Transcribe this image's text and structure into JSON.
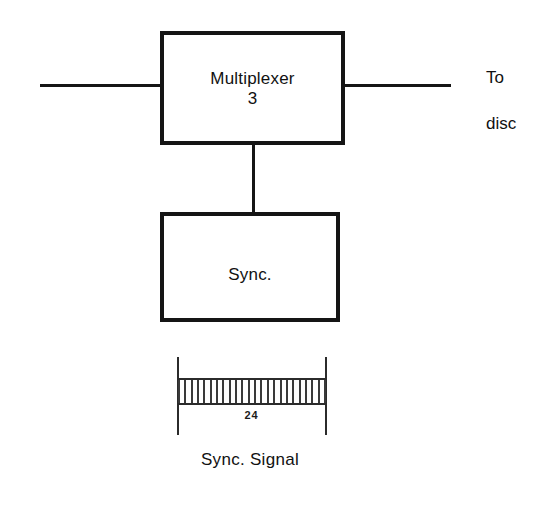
{
  "diagram": {
    "background_color": "#ffffff",
    "line_color": "#151515",
    "blocks": [
      {
        "name": "multiplexer",
        "label": "Multiplexer\n3",
        "line1": "Multiplexer",
        "line2": "3"
      },
      {
        "name": "sync",
        "label": "Sync."
      }
    ],
    "wires": [
      {
        "name": "input-wire",
        "orientation": "horizontal"
      },
      {
        "name": "output-wire",
        "orientation": "horizontal"
      },
      {
        "name": "mux-to-sync-wire",
        "orientation": "vertical"
      }
    ],
    "annotations": {
      "to_disc": "To\ndisc",
      "to_disc_line1": "To",
      "to_disc_line2": "disc"
    },
    "signal": {
      "caption": "Sync. Signal",
      "count_label": "24"
    }
  },
  "chart_data": {
    "type": "bar",
    "title": "Sync. Signal",
    "xlabel": "",
    "ylabel": "",
    "categories": [
      "1",
      "2",
      "3",
      "4",
      "5",
      "6",
      "7",
      "8",
      "9",
      "10",
      "11",
      "12",
      "13",
      "14",
      "15",
      "16",
      "17",
      "18",
      "19",
      "20",
      "21",
      "22",
      "23",
      "24"
    ],
    "values": [
      1,
      1,
      1,
      1,
      1,
      1,
      1,
      1,
      1,
      1,
      1,
      1,
      1,
      1,
      1,
      1,
      1,
      1,
      1,
      1,
      1,
      1,
      1,
      1
    ],
    "annotations": [
      "24"
    ],
    "legend": "none",
    "grid": false
  }
}
